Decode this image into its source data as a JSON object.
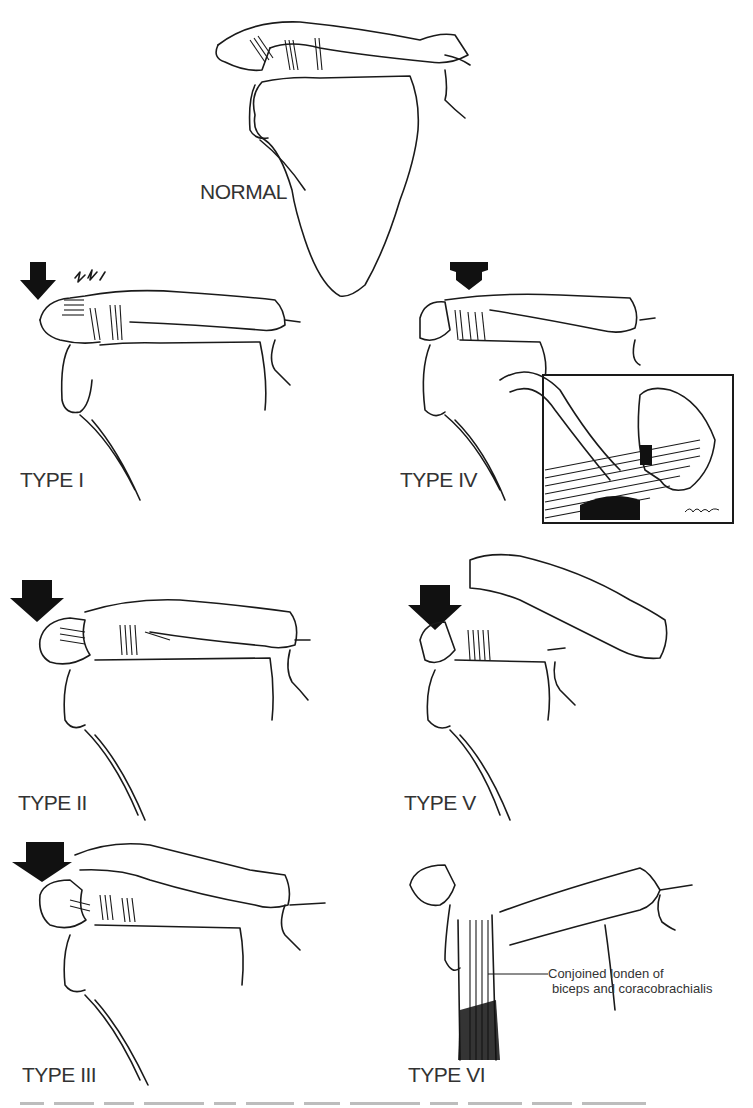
{
  "figure": {
    "panels": [
      {
        "id": "normal",
        "label": "NORMAL",
        "arrow": "none"
      },
      {
        "id": "type1",
        "label": "TYPE I",
        "arrow": "down"
      },
      {
        "id": "type2",
        "label": "TYPE II",
        "arrow": "down"
      },
      {
        "id": "type3",
        "label": "TYPE III",
        "arrow": "down"
      },
      {
        "id": "type4",
        "label": "TYPE IV",
        "arrow": "down-flat"
      },
      {
        "id": "type5",
        "label": "TYPE V",
        "arrow": "down"
      },
      {
        "id": "type6",
        "label": "TYPE VI",
        "arrow": "none"
      }
    ],
    "annotation": {
      "line1": "Conjoined londen of",
      "line2": "biceps and coracobrachialis"
    },
    "inset": {
      "signature": "Mornheuk"
    },
    "colors": {
      "ink": "#1a1a1a",
      "background": "#ffffff"
    }
  }
}
